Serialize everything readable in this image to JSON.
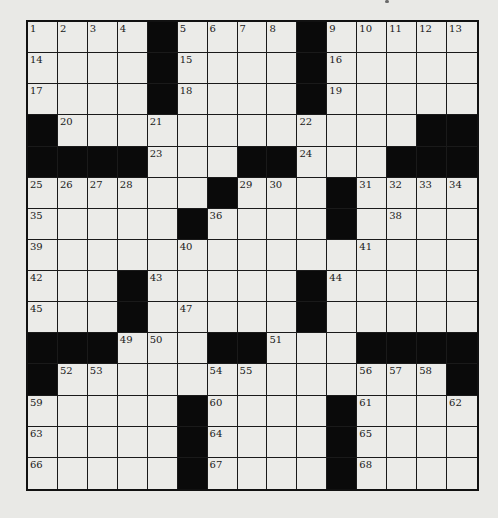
{
  "puzzle": {
    "rows": 15,
    "cols": 15,
    "layout": [
      "....#....#.....",
      "....#....#.....",
      "....#....#.....",
      "#............##",
      "####...##...###",
      "......#...#....",
      ".....#....#....",
      "...............",
      "...#.....#.....",
      "...#.....#.....",
      "###...##...####",
      "#.............#",
      ".....#....#....",
      ".....#....#....",
      ".....#....#...."
    ],
    "numbers": [
      [
        1,
        2,
        3,
        4,
        null,
        5,
        6,
        7,
        8,
        null,
        9,
        10,
        11,
        12,
        13
      ],
      [
        14,
        null,
        null,
        null,
        null,
        15,
        null,
        null,
        null,
        null,
        16,
        null,
        null,
        null,
        null
      ],
      [
        17,
        null,
        null,
        null,
        null,
        18,
        null,
        null,
        null,
        null,
        19,
        null,
        null,
        null,
        null
      ],
      [
        null,
        20,
        null,
        null,
        21,
        null,
        null,
        null,
        null,
        22,
        null,
        null,
        null,
        null,
        null
      ],
      [
        null,
        null,
        null,
        null,
        23,
        null,
        null,
        null,
        null,
        24,
        null,
        null,
        null,
        null,
        null
      ],
      [
        25,
        26,
        27,
        28,
        null,
        null,
        null,
        29,
        30,
        null,
        null,
        31,
        32,
        33,
        34
      ],
      [
        35,
        null,
        null,
        null,
        null,
        null,
        36,
        null,
        null,
        null,
        37,
        null,
        38,
        null,
        null
      ],
      [
        39,
        null,
        null,
        null,
        null,
        40,
        null,
        null,
        null,
        null,
        null,
        41,
        null,
        null,
        null
      ],
      [
        42,
        null,
        null,
        null,
        43,
        null,
        null,
        null,
        null,
        null,
        44,
        null,
        null,
        null,
        null
      ],
      [
        45,
        null,
        null,
        46,
        null,
        47,
        null,
        null,
        null,
        48,
        null,
        null,
        null,
        null,
        null
      ],
      [
        null,
        null,
        null,
        49,
        50,
        null,
        null,
        null,
        51,
        null,
        null,
        null,
        null,
        null,
        null
      ],
      [
        null,
        52,
        53,
        null,
        null,
        null,
        54,
        55,
        null,
        null,
        null,
        56,
        57,
        58,
        null
      ],
      [
        59,
        null,
        null,
        null,
        null,
        null,
        60,
        null,
        null,
        null,
        null,
        61,
        null,
        null,
        62
      ],
      [
        63,
        null,
        null,
        null,
        null,
        null,
        64,
        null,
        null,
        null,
        null,
        65,
        null,
        null,
        null
      ],
      [
        66,
        null,
        null,
        null,
        null,
        null,
        67,
        null,
        null,
        null,
        null,
        68,
        null,
        null,
        null
      ]
    ]
  },
  "colors": {
    "background": "#e9e9e6",
    "cell": "#ebebe8",
    "block": "#0a0a0a",
    "line": "#1a1a1a"
  }
}
